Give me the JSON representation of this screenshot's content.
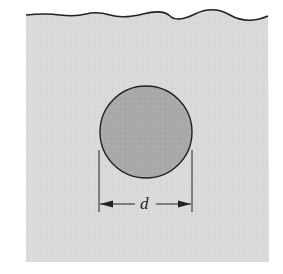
{
  "figure": {
    "dimension_label": "d",
    "colors": {
      "background": "#ffffff",
      "fluid": "#d9d9d9",
      "circle_fill": "#a9a9a9",
      "line": "#222222"
    }
  }
}
